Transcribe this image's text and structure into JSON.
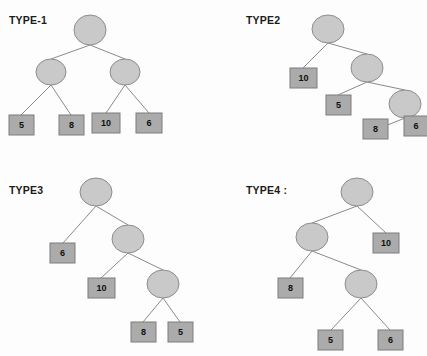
{
  "figure": {
    "background_color": "#fdfdfd",
    "circle_fill": "#c9c9c9",
    "circle_stroke": "#8d8d8d",
    "box_fill": "#ababab",
    "box_stroke": "#7d7d7d",
    "edge_color": "#8a8a8a",
    "label_color": "#1b1b1b",
    "leaf_text_color": "#101010"
  },
  "panels": [
    {
      "id": "type1",
      "title": "TYPE-1",
      "title_x": 9,
      "title_y": 14,
      "circles": [
        {
          "name": "root",
          "cx": 90,
          "cy": 30,
          "rx": 16,
          "ry": 15
        },
        {
          "name": "internal-left",
          "cx": 51,
          "cy": 72,
          "rx": 15,
          "ry": 13
        },
        {
          "name": "internal-right",
          "cx": 125,
          "cy": 72,
          "rx": 15,
          "ry": 13
        }
      ],
      "boxes": [
        {
          "name": "leaf-1",
          "label": "5",
          "x": 9,
          "y": 115,
          "w": 25,
          "h": 20
        },
        {
          "name": "leaf-2",
          "label": "8",
          "x": 59,
          "y": 115,
          "w": 25,
          "h": 20
        },
        {
          "name": "leaf-3",
          "label": "10",
          "x": 92,
          "y": 113,
          "w": 28,
          "h": 20
        },
        {
          "name": "leaf-4",
          "label": "6",
          "x": 136,
          "y": 113,
          "w": 26,
          "h": 20
        }
      ],
      "edges": [
        {
          "x1": 90,
          "y1": 45,
          "x2": 51,
          "y2": 59
        },
        {
          "x1": 90,
          "y1": 45,
          "x2": 125,
          "y2": 59
        },
        {
          "x1": 51,
          "y1": 85,
          "x2": 21,
          "y2": 115
        },
        {
          "x1": 51,
          "y1": 85,
          "x2": 71,
          "y2": 115
        },
        {
          "x1": 125,
          "y1": 85,
          "x2": 106,
          "y2": 113
        },
        {
          "x1": 125,
          "y1": 85,
          "x2": 149,
          "y2": 113
        }
      ]
    },
    {
      "id": "type2",
      "title": "TYPE2",
      "title_x": 246,
      "title_y": 14,
      "circles": [
        {
          "name": "root",
          "cx": 328,
          "cy": 29,
          "rx": 16,
          "ry": 14
        },
        {
          "name": "internal-1",
          "cx": 367,
          "cy": 68,
          "rx": 16,
          "ry": 14
        },
        {
          "name": "internal-2",
          "cx": 405,
          "cy": 104,
          "rx": 16,
          "ry": 14
        }
      ],
      "boxes": [
        {
          "name": "leaf-1",
          "label": "10",
          "x": 290,
          "y": 68,
          "w": 27,
          "h": 20
        },
        {
          "name": "leaf-2",
          "label": "5",
          "x": 326,
          "y": 95,
          "w": 25,
          "h": 20
        },
        {
          "name": "leaf-3",
          "label": "8",
          "x": 363,
          "y": 119,
          "w": 25,
          "h": 20
        },
        {
          "name": "leaf-4",
          "label": "6",
          "x": 404,
          "y": 116,
          "w": 24,
          "h": 20
        }
      ],
      "edges": [
        {
          "x1": 328,
          "y1": 43,
          "x2": 303,
          "y2": 68
        },
        {
          "x1": 328,
          "y1": 43,
          "x2": 367,
          "y2": 54
        },
        {
          "x1": 367,
          "y1": 82,
          "x2": 338,
          "y2": 95
        },
        {
          "x1": 367,
          "y1": 82,
          "x2": 405,
          "y2": 90
        },
        {
          "x1": 405,
          "y1": 118,
          "x2": 375,
          "y2": 130
        },
        {
          "x1": 405,
          "y1": 118,
          "x2": 416,
          "y2": 128
        }
      ]
    },
    {
      "id": "type3",
      "title": "TYPE3",
      "title_x": 9,
      "title_y": 184,
      "circles": [
        {
          "name": "root",
          "cx": 96,
          "cy": 192,
          "rx": 16,
          "ry": 14
        },
        {
          "name": "internal-1",
          "cx": 128,
          "cy": 239,
          "rx": 16,
          "ry": 14
        },
        {
          "name": "internal-2",
          "cx": 163,
          "cy": 284,
          "rx": 16,
          "ry": 14
        }
      ],
      "boxes": [
        {
          "name": "leaf-1",
          "label": "6",
          "x": 50,
          "y": 243,
          "w": 25,
          "h": 20
        },
        {
          "name": "leaf-2",
          "label": "10",
          "x": 88,
          "y": 278,
          "w": 27,
          "h": 20
        },
        {
          "name": "leaf-3",
          "label": "8",
          "x": 131,
          "y": 322,
          "w": 25,
          "h": 20
        },
        {
          "name": "leaf-4",
          "label": "5",
          "x": 168,
          "y": 322,
          "w": 25,
          "h": 20
        }
      ],
      "edges": [
        {
          "x1": 96,
          "y1": 206,
          "x2": 63,
          "y2": 243
        },
        {
          "x1": 96,
          "y1": 206,
          "x2": 128,
          "y2": 225
        },
        {
          "x1": 128,
          "y1": 253,
          "x2": 101,
          "y2": 278
        },
        {
          "x1": 128,
          "y1": 253,
          "x2": 163,
          "y2": 270
        },
        {
          "x1": 163,
          "y1": 298,
          "x2": 143,
          "y2": 322
        },
        {
          "x1": 163,
          "y1": 298,
          "x2": 180,
          "y2": 322
        }
      ]
    },
    {
      "id": "type4",
      "title": "TYPE4 :",
      "title_x": 246,
      "title_y": 184,
      "circles": [
        {
          "name": "root",
          "cx": 357,
          "cy": 192,
          "rx": 16,
          "ry": 14
        },
        {
          "name": "internal-1",
          "cx": 312,
          "cy": 237,
          "rx": 16,
          "ry": 14
        },
        {
          "name": "internal-2",
          "cx": 361,
          "cy": 284,
          "rx": 16,
          "ry": 14
        }
      ],
      "boxes": [
        {
          "name": "leaf-1",
          "label": "10",
          "x": 373,
          "y": 233,
          "w": 26,
          "h": 20
        },
        {
          "name": "leaf-2",
          "label": "8",
          "x": 278,
          "y": 278,
          "w": 25,
          "h": 20
        },
        {
          "name": "leaf-3",
          "label": "5",
          "x": 318,
          "y": 330,
          "w": 25,
          "h": 20
        },
        {
          "name": "leaf-4",
          "label": "6",
          "x": 378,
          "y": 330,
          "w": 25,
          "h": 20
        }
      ],
      "edges": [
        {
          "x1": 357,
          "y1": 206,
          "x2": 312,
          "y2": 223
        },
        {
          "x1": 357,
          "y1": 206,
          "x2": 386,
          "y2": 233
        },
        {
          "x1": 312,
          "y1": 251,
          "x2": 290,
          "y2": 278
        },
        {
          "x1": 312,
          "y1": 251,
          "x2": 361,
          "y2": 270
        },
        {
          "x1": 361,
          "y1": 298,
          "x2": 331,
          "y2": 330
        },
        {
          "x1": 361,
          "y1": 298,
          "x2": 390,
          "y2": 330
        }
      ]
    }
  ]
}
